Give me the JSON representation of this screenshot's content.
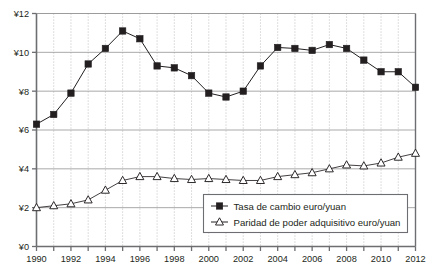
{
  "chart_data": {
    "type": "line",
    "title": "",
    "subtitle": "",
    "xlabel": "",
    "ylabel": "",
    "xlim": [
      1990,
      2012
    ],
    "ylim": [
      0,
      12
    ],
    "ytick_step": 2,
    "grid": "horizontal solid gray, vertical dotted gray (yearly)",
    "legend_position": "bottom-right inside plot",
    "currency_prefix": "¥",
    "x": [
      1990,
      1991,
      1992,
      1993,
      1994,
      1995,
      1996,
      1997,
      1998,
      1999,
      2000,
      2001,
      2002,
      2003,
      2004,
      2005,
      2006,
      2007,
      2008,
      2009,
      2010,
      2011,
      2012
    ],
    "xtick_labels": [
      "1990",
      "",
      "1992",
      "",
      "1994",
      "",
      "1996",
      "",
      "1998",
      "",
      "2000",
      "",
      "2002",
      "",
      "2004",
      "",
      "2006",
      "",
      "2008",
      "",
      "2010",
      "",
      "2012"
    ],
    "ytick_labels": [
      "¥0",
      "¥2",
      "¥4",
      "¥6",
      "¥8",
      "¥10",
      "¥12"
    ],
    "ytick_values": [
      0,
      2,
      4,
      6,
      8,
      10,
      12
    ],
    "series": [
      {
        "name": "Tasa de cambio euro/yuan",
        "marker": "filled-square",
        "color": "#231f20",
        "values": [
          6.3,
          6.8,
          7.9,
          9.4,
          10.2,
          11.1,
          10.7,
          9.3,
          9.2,
          8.8,
          7.9,
          7.7,
          8.0,
          9.3,
          10.25,
          10.2,
          10.1,
          10.4,
          10.2,
          9.6,
          9.0,
          9.0,
          8.2
        ]
      },
      {
        "name": "Paridad de poder adquisitivo euro/yuan",
        "marker": "open-triangle",
        "color": "#231f20",
        "values": [
          2.0,
          2.1,
          2.2,
          2.4,
          2.9,
          3.4,
          3.6,
          3.6,
          3.5,
          3.45,
          3.5,
          3.45,
          3.4,
          3.4,
          3.6,
          3.7,
          3.8,
          4.0,
          4.2,
          4.15,
          4.3,
          4.6,
          4.8
        ]
      }
    ]
  },
  "legend": {
    "items": [
      {
        "label": "Tasa de cambio euro/yuan",
        "marker": "filled-square"
      },
      {
        "label": "Paridad de poder adquisitivo euro/yuan",
        "marker": "open-triangle"
      }
    ]
  },
  "colors": {
    "axis": "#6d6e71",
    "gridline": "#9a9a9a",
    "vgrid": "#b5b5b5",
    "series": "#231f20",
    "text": "#231f20",
    "background": "#ffffff"
  }
}
